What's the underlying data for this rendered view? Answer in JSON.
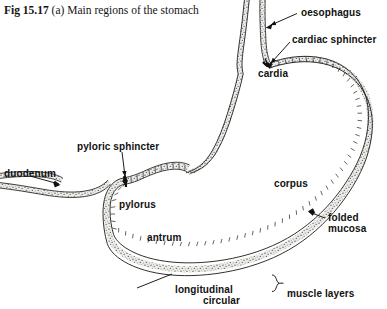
{
  "figure": {
    "caption": {
      "prefix": "Fig",
      "number": "15.17",
      "part": "(a)",
      "text": "Main regions of the stomach"
    },
    "title_full": "Fig 15.17 (a) Main regions of the stomach",
    "colors": {
      "background": "#ffffff",
      "ink": "#111111",
      "wall_fill": "#e8e6e2",
      "stipple": "#3a3a3a"
    }
  },
  "labels": {
    "oesophagus": "oesophagus",
    "cardiac_sphincter": "cardiac sphincter",
    "cardia": "cardia",
    "pyloric_sphincter": "pyloric sphincter",
    "duodenum": "duodenum",
    "pylorus": "pylorus",
    "corpus": "corpus",
    "folded_mucosa_line1": "folded",
    "folded_mucosa_line2": "mucosa",
    "antrum": "antrum",
    "longitudinal": "longitudinal",
    "circular": "circular",
    "muscle_layers": "muscle layers"
  },
  "annotations": [
    {
      "name": "oesophagus",
      "leader": "arrow",
      "target": "oesophageal-tube"
    },
    {
      "name": "cardiac sphincter",
      "leader": "arrow",
      "target": "cardiac-sphincter-junction"
    },
    {
      "name": "cardia",
      "leader": "none",
      "target": "cardia-region"
    },
    {
      "name": "pyloric sphincter",
      "leader": "arrow",
      "target": "pyloric-sphincter-junction"
    },
    {
      "name": "duodenum",
      "leader": "arrow",
      "target": "duodenal-tube"
    },
    {
      "name": "pylorus",
      "leader": "none",
      "target": "pylorus-region"
    },
    {
      "name": "corpus",
      "leader": "none",
      "target": "corpus-region"
    },
    {
      "name": "folded mucosa",
      "leader": "arrow",
      "target": "greater-curvature-mucosa"
    },
    {
      "name": "antrum",
      "leader": "none",
      "target": "antrum-region"
    },
    {
      "name": "longitudinal",
      "leader": "line",
      "target": "muscle-wall"
    },
    {
      "name": "circular",
      "leader": "brace",
      "target": "muscle-wall"
    },
    {
      "name": "muscle layers",
      "leader": "brace",
      "target": "muscle-layer-group"
    }
  ]
}
